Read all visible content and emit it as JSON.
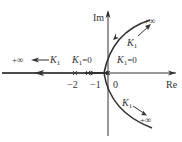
{
  "diagram": {
    "type": "root-locus",
    "axes": {
      "real_label": "Re",
      "imag_label": "Im"
    },
    "ticks": [
      {
        "id": "tick-minus-2",
        "label": "−2",
        "value": -2
      },
      {
        "id": "tick-minus-1",
        "label": "−1",
        "value": -1
      },
      {
        "id": "tick-zero",
        "label": "0",
        "value": 0
      }
    ],
    "annotations": {
      "left_infinity": "+∞",
      "left_gain": "K",
      "left_gain_sub": "1",
      "k0_left_main": "K",
      "k0_left_sub": "1",
      "k0_left_eq": "=0",
      "k0_right_main": "K",
      "k0_right_sub": "1",
      "k0_right_eq": "=0",
      "upper_gain": "K",
      "upper_gain_sub": "1",
      "upper_infinity": "+∞",
      "lower_gain": "K",
      "lower_gain_sub": "1",
      "lower_infinity": "+∞"
    },
    "colors": {
      "line": "#333333",
      "background": "#ffffff"
    }
  }
}
